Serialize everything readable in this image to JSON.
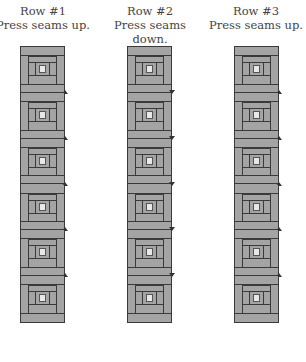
{
  "diagram": {
    "rows": [
      {
        "label": "Row #1",
        "instruction": "Press seams up.",
        "direction": "up",
        "blocks": 6,
        "color_fill": "#a4a4a4",
        "color_center": "#e8e8e8"
      },
      {
        "label": "Row #2",
        "instruction": "Press seams down.",
        "direction": "down",
        "blocks": 6,
        "color_fill": "#a4a4a4",
        "color_center": "#e8e8e8"
      },
      {
        "label": "Row #3",
        "instruction": "Press seams up.",
        "direction": "up",
        "blocks": 6,
        "color_fill": "#a4a4a4",
        "color_center": "#e8e8e8"
      }
    ],
    "colors": {
      "fill": "#a4a4a4",
      "line": "#3a3a3a",
      "center": "#e8e8e8",
      "text": "#444444"
    }
  }
}
